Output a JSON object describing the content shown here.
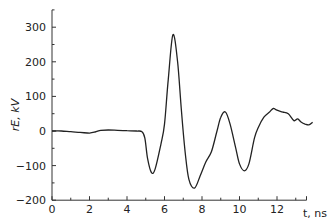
{
  "chart_data": {
    "type": "line",
    "title": "",
    "xlabel": "t, ns",
    "ylabel": "rE, kV",
    "xlim": [
      0,
      14
    ],
    "ylim": [
      -200,
      350
    ],
    "x_ticks": [
      0,
      2,
      4,
      6,
      8,
      10,
      12
    ],
    "x_tick_labels": [
      "0",
      "2",
      "4",
      "6",
      "8",
      "10",
      "12"
    ],
    "y_ticks": [
      -200,
      -100,
      0,
      100,
      200,
      300
    ],
    "y_tick_labels": [
      "−200",
      "−100",
      "0",
      "100",
      "200",
      "300"
    ],
    "grid": false,
    "legend": null,
    "series": [
      {
        "name": "rE",
        "x": [
          0,
          0.5,
          1.0,
          1.5,
          2.0,
          2.3,
          2.6,
          3.0,
          3.5,
          4.0,
          4.5,
          4.8,
          4.95,
          5.1,
          5.3,
          5.5,
          5.8,
          6.0,
          6.2,
          6.45,
          6.7,
          6.9,
          7.1,
          7.3,
          7.6,
          7.9,
          8.2,
          8.5,
          8.8,
          9.0,
          9.25,
          9.5,
          9.8,
          10.0,
          10.25,
          10.5,
          10.8,
          11.0,
          11.3,
          11.6,
          11.8,
          12.0,
          12.3,
          12.6,
          12.9,
          13.1,
          13.3,
          13.5,
          13.7,
          13.9
        ],
        "values": [
          0,
          0,
          -2,
          -4,
          -6,
          -3,
          2,
          3,
          2,
          1,
          0,
          -2,
          -20,
          -80,
          -120,
          -110,
          -40,
          20,
          150,
          278,
          200,
          60,
          -60,
          -140,
          -165,
          -130,
          -90,
          -60,
          0,
          40,
          55,
          20,
          -50,
          -95,
          -115,
          -95,
          -20,
          10,
          40,
          55,
          65,
          60,
          55,
          50,
          30,
          35,
          25,
          20,
          18,
          25
        ]
      }
    ]
  }
}
